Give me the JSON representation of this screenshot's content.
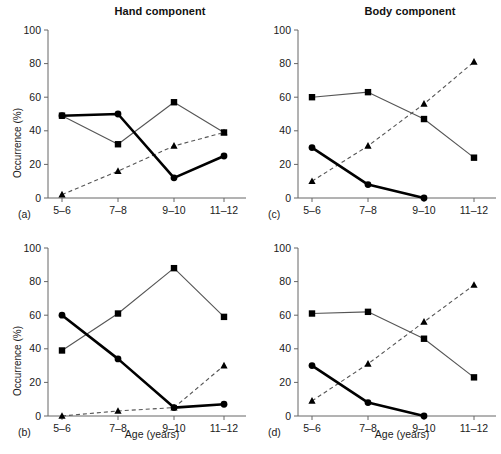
{
  "figure": {
    "column_titles": [
      "Hand component",
      "Body component"
    ],
    "y_axis_label": "Occurrence (%)",
    "x_axis_label": "Age (years)",
    "panel_labels": [
      "(a)",
      "(b)",
      "(c)",
      "(d)"
    ]
  },
  "chart_data": [
    {
      "type": "line",
      "panel": "(a)",
      "title": "Hand component",
      "xlabel": "",
      "ylabel": "Occurrence (%)",
      "categories": [
        "5–6",
        "7–8",
        "9–10",
        "11–12"
      ],
      "xticklabels": [
        "5–6",
        "7–8",
        "9–10",
        "11–12"
      ],
      "yticklabels": [
        "0",
        "20",
        "40",
        "60",
        "80",
        "100"
      ],
      "ylim": [
        0,
        100
      ],
      "grid": false,
      "legend": "none",
      "series": [
        {
          "name": "circle-thick",
          "marker": "circle",
          "line": "solid-thick",
          "values": [
            49,
            50,
            12,
            25
          ]
        },
        {
          "name": "square-thin",
          "marker": "square",
          "line": "solid-thin",
          "values": [
            49,
            32,
            57,
            39
          ]
        },
        {
          "name": "triangle-dashed",
          "marker": "triangle",
          "line": "dashed",
          "values": [
            2,
            16,
            31,
            39
          ]
        }
      ]
    },
    {
      "type": "line",
      "panel": "(b)",
      "title": "Hand component",
      "xlabel": "Age (years)",
      "ylabel": "Occurrence (%)",
      "categories": [
        "5–6",
        "7–8",
        "9–10",
        "11–12"
      ],
      "xticklabels": [
        "5–6",
        "7–8",
        "9–10",
        "11–12"
      ],
      "yticklabels": [
        "0",
        "20",
        "40",
        "60",
        "80",
        "100"
      ],
      "ylim": [
        0,
        100
      ],
      "grid": false,
      "legend": "none",
      "series": [
        {
          "name": "circle-thick",
          "marker": "circle",
          "line": "solid-thick",
          "values": [
            60,
            34,
            5,
            7
          ]
        },
        {
          "name": "square-thin",
          "marker": "square",
          "line": "solid-thin",
          "values": [
            39,
            61,
            88,
            59
          ]
        },
        {
          "name": "triangle-dashed",
          "marker": "triangle",
          "line": "dashed",
          "values": [
            0,
            3,
            5,
            30
          ]
        }
      ]
    },
    {
      "type": "line",
      "panel": "(c)",
      "title": "Body component",
      "xlabel": "",
      "ylabel": "",
      "categories": [
        "5–6",
        "7–8",
        "9–10",
        "11–12"
      ],
      "xticklabels": [
        "5–6",
        "7–8",
        "9–10",
        "11–12"
      ],
      "yticklabels": [
        "0",
        "20",
        "40",
        "60",
        "80",
        "100"
      ],
      "ylim": [
        0,
        100
      ],
      "grid": false,
      "legend": "none",
      "series": [
        {
          "name": "circle-thick",
          "marker": "circle",
          "line": "solid-thick",
          "values": [
            30,
            8,
            0,
            null
          ]
        },
        {
          "name": "square-thin",
          "marker": "square",
          "line": "solid-thin",
          "values": [
            60,
            63,
            47,
            24
          ]
        },
        {
          "name": "triangle-dashed",
          "marker": "triangle",
          "line": "dashed",
          "values": [
            10,
            31,
            56,
            81
          ]
        }
      ]
    },
    {
      "type": "line",
      "panel": "(d)",
      "title": "Body component",
      "xlabel": "Age (years)",
      "ylabel": "",
      "categories": [
        "5–6",
        "7–8",
        "9–10",
        "11–12"
      ],
      "xticklabels": [
        "5–6",
        "7–8",
        "9–10",
        "11–12"
      ],
      "yticklabels": [
        "0",
        "20",
        "40",
        "60",
        "80",
        "100"
      ],
      "ylim": [
        0,
        100
      ],
      "grid": false,
      "legend": "none",
      "series": [
        {
          "name": "circle-thick",
          "marker": "circle",
          "line": "solid-thick",
          "values": [
            30,
            8,
            0,
            null
          ]
        },
        {
          "name": "square-thin",
          "marker": "square",
          "line": "solid-thin",
          "values": [
            61,
            62,
            46,
            23
          ]
        },
        {
          "name": "triangle-dashed",
          "marker": "triangle",
          "line": "dashed",
          "values": [
            9,
            31,
            56,
            78
          ]
        }
      ]
    }
  ]
}
